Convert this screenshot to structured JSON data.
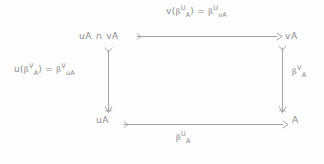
{
  "diagram": {
    "type": "commutative-square",
    "title": "",
    "ink_color": "#8a8a8a",
    "background_color": "#fdfdfd",
    "nodes": {
      "top_left": "uA ∩ vA",
      "top_right": "vA",
      "bottom_left": "uA",
      "bottom_right": "A"
    },
    "arrow_labels": {
      "top": {
        "fn": "v(",
        "beta1": "β",
        "sub1": "A",
        "sup1": "U",
        "close": ")",
        "equals": "=",
        "beta2": "β",
        "sub2": "vA",
        "sup2": "U"
      },
      "left": {
        "fn": "u(",
        "beta1": "β",
        "sub1": "A",
        "sup1": "V",
        "close": ")",
        "equals": "=",
        "beta2": "β",
        "sub2": "uA",
        "sup2": "V"
      },
      "right": {
        "beta": "β",
        "sub": "A",
        "sup": "V"
      },
      "bottom": {
        "beta": "β",
        "sub": "A",
        "sup": "U"
      }
    },
    "arrows": [
      {
        "name": "top-arrow",
        "from": "uA ∩ vA",
        "to": "vA",
        "direction": "right"
      },
      {
        "name": "bottom-arrow",
        "from": "uA",
        "to": "A",
        "direction": "right"
      },
      {
        "name": "left-arrow",
        "from": "uA ∩ vA",
        "to": "uA",
        "direction": "down"
      },
      {
        "name": "right-arrow",
        "from": "vA",
        "to": "A",
        "direction": "down"
      }
    ]
  }
}
